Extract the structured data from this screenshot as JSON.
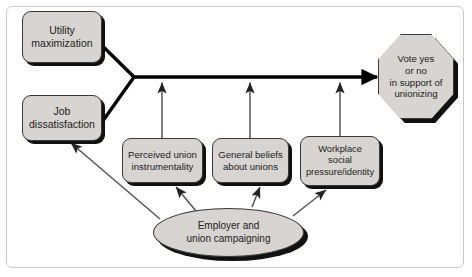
{
  "diagram": {
    "background_color": "#ffffff",
    "node_fill": "#d7d4d1",
    "node_stroke": "#3a3a3a",
    "shadow_color": "#111111",
    "text_color": "#1c1c1c",
    "nodes": [
      {
        "id": "utility-maximization",
        "shape": "rounded-rectangle",
        "lines": [
          "Utility",
          "maximization"
        ]
      },
      {
        "id": "job-dissatisfaction",
        "shape": "rounded-rectangle",
        "lines": [
          "Job",
          "dissatisfaction"
        ]
      },
      {
        "id": "perceived-union-instrumentality",
        "shape": "rounded-rectangle",
        "lines": [
          "Perceived union",
          "instrumentality"
        ]
      },
      {
        "id": "general-beliefs-about-unions",
        "shape": "rounded-rectangle",
        "lines": [
          "General beliefs",
          "about unions"
        ]
      },
      {
        "id": "workplace-social-pressure-identity",
        "shape": "rounded-rectangle",
        "lines": [
          "Workplace",
          "social",
          "pressure/identity"
        ]
      },
      {
        "id": "employer-and-union-campaigning",
        "shape": "ellipse",
        "lines": [
          "Employer and",
          "union campaigning"
        ]
      },
      {
        "id": "vote-yes-or-no",
        "shape": "octagon",
        "lines": [
          "Vote yes",
          "or no",
          "in support of",
          "unionizing"
        ]
      }
    ],
    "edges": [
      {
        "id": "utility-to-junction",
        "from": "utility-maximization",
        "to": "junction",
        "style": "thick-line",
        "arrowhead": false
      },
      {
        "id": "job-to-junction",
        "from": "job-dissatisfaction",
        "to": "junction",
        "style": "thick-line",
        "arrowhead": false
      },
      {
        "id": "junction-to-vote",
        "from": "junction",
        "to": "vote-yes-or-no",
        "style": "thick-arrow",
        "arrowhead": true
      },
      {
        "id": "instrumentality-to-main",
        "from": "perceived-union-instrumentality",
        "to": "junction-to-vote",
        "style": "thin-arrow",
        "arrowhead": true
      },
      {
        "id": "beliefs-to-main",
        "from": "general-beliefs-about-unions",
        "to": "junction-to-vote",
        "style": "thin-arrow",
        "arrowhead": true
      },
      {
        "id": "workplace-to-main",
        "from": "workplace-social-pressure-identity",
        "to": "junction-to-vote",
        "style": "thin-arrow",
        "arrowhead": true
      },
      {
        "id": "campaigning-to-job",
        "from": "employer-and-union-campaigning",
        "to": "job-dissatisfaction",
        "style": "thin-arrow",
        "arrowhead": true
      },
      {
        "id": "campaigning-to-instrumentality",
        "from": "employer-and-union-campaigning",
        "to": "perceived-union-instrumentality",
        "style": "thin-arrow",
        "arrowhead": true
      },
      {
        "id": "campaigning-to-beliefs",
        "from": "employer-and-union-campaigning",
        "to": "general-beliefs-about-unions",
        "style": "thin-arrow",
        "arrowhead": true
      },
      {
        "id": "campaigning-to-workplace",
        "from": "employer-and-union-campaigning",
        "to": "workplace-social-pressure-identity",
        "style": "thin-arrow",
        "arrowhead": true
      }
    ]
  }
}
